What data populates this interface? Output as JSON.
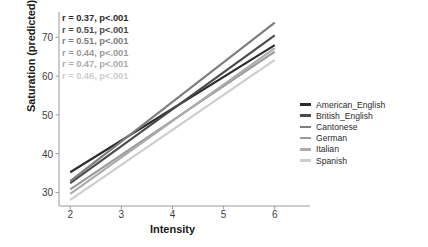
{
  "chart_data": {
    "type": "line",
    "title": "",
    "xlabel": "Intensity",
    "ylabel": "Saturation (predicted)",
    "xlim": [
      1.78,
      6.22
    ],
    "ylim": [
      26.5,
      75.5
    ],
    "xticks": [
      "2",
      "3",
      "4",
      "5",
      "6"
    ],
    "xtick_values": [
      2,
      3,
      4,
      5,
      6
    ],
    "yticks": [
      "30",
      "40",
      "50",
      "60",
      "70"
    ],
    "ytick_values": [
      30,
      40,
      50,
      60,
      70
    ],
    "grid": false,
    "legend_position": "right",
    "x": [
      2,
      6
    ],
    "series": [
      {
        "name": "American_English",
        "color": "#2c2c2c",
        "values": [
          35.2,
          68.0
        ],
        "r": "0.37",
        "p": "p<.001",
        "annotation": "r = 0.37, p<.001"
      },
      {
        "name": "British_English",
        "color": "#4a4a4a",
        "values": [
          32.4,
          70.5
        ],
        "r": "0.51",
        "p": "p<.001",
        "annotation": "r = 0.51, p<.001"
      },
      {
        "name": "Cantonese",
        "color": "#7d7d7d",
        "values": [
          32.9,
          73.8
        ],
        "r": "0.51",
        "p": "p<.001",
        "annotation": "r = 0.51, p<.001"
      },
      {
        "name": "German",
        "color": "#9a9a9a",
        "values": [
          30.8,
          66.3
        ],
        "r": "0.44",
        "p": "p<.001",
        "annotation": "r = 0.44, p<.001"
      },
      {
        "name": "Italian",
        "color": "#ababab",
        "values": [
          29.6,
          67.2
        ],
        "r": "0.47",
        "p": "p<.001",
        "annotation": "r = 0.47, p<.001"
      },
      {
        "name": "Spanish",
        "color": "#cdcdcd",
        "values": [
          28.1,
          64.2
        ],
        "r": "0.46",
        "p": "p<.001",
        "annotation": "r = 0.46, p<.001"
      }
    ]
  },
  "axes": {
    "spine_color": "#9a9a9a",
    "tick_color": "#3d3d3d",
    "background": "#ffffff"
  }
}
